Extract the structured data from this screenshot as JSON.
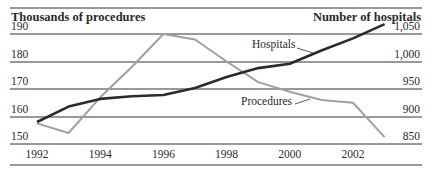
{
  "chart_data": {
    "type": "line",
    "title": "",
    "xlabel": "",
    "ylabel_left": "Thousands of procedures",
    "ylabel_right": "Number of hospitals",
    "x": [
      1992,
      1993,
      1994,
      1995,
      1996,
      1997,
      1998,
      1999,
      2000,
      2001,
      2002,
      2003
    ],
    "x_tick_labels": [
      "1992",
      "1994",
      "1996",
      "1998",
      "2000",
      "2002"
    ],
    "y_left_ticks": [
      "190",
      "180",
      "170",
      "160",
      "150"
    ],
    "y_right_ticks": [
      "1,050",
      "1,000",
      "950",
      "900",
      "850"
    ],
    "ylim_left": [
      150,
      190
    ],
    "ylim_right": [
      850,
      1050
    ],
    "grid": true,
    "series": [
      {
        "name": "Procedures",
        "axis": "left",
        "color": "#a0a0a0",
        "values": [
          157.5,
          154,
          167,
          178,
          190,
          188,
          180,
          172.5,
          169,
          166,
          165,
          152.5
        ]
      },
      {
        "name": "Hospitals",
        "axis": "right",
        "color": "#2b2b2b",
        "values": [
          890,
          918,
          932,
          937,
          939,
          952,
          972,
          988,
          996,
          1020,
          1042,
          1068
        ]
      }
    ],
    "annotations": [
      {
        "text": "Hospitals",
        "series": "Hospitals"
      },
      {
        "text": "Procedures",
        "series": "Procedures"
      }
    ]
  }
}
